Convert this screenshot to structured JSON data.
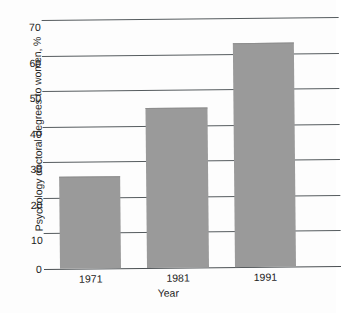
{
  "chart_data": {
    "type": "bar",
    "title": "",
    "subtitle": "",
    "xlabel": "Year",
    "ylabel": "Psychology doctoral degrees to women, %",
    "categories": [
      "1971",
      "1981",
      "1991"
    ],
    "values": [
      26,
      45,
      63
    ],
    "series": [
      {
        "name": "Psychology doctoral degrees to women",
        "values": [
          26,
          45,
          63
        ]
      }
    ],
    "ylim": [
      0,
      70
    ],
    "yticks": [
      0,
      10,
      20,
      30,
      40,
      50,
      60,
      70
    ],
    "ytick_labels": [
      "0",
      "10",
      "20",
      "30",
      "40",
      "50",
      "60",
      "70"
    ],
    "grid": "horizontal",
    "legend": "none",
    "bar_color": "#9a9a9a",
    "gridline_color": "#555b5e",
    "background_color": "#ffffff"
  }
}
